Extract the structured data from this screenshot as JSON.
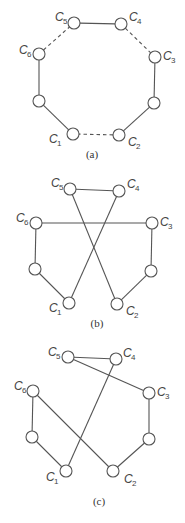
{
  "figure": {
    "panels": [
      {
        "id": "a",
        "caption": "(a)",
        "caption_pos": [
          92,
          158
        ],
        "nodes": [
          {
            "id": "C1",
            "label": "C",
            "sub": "1",
            "x": 73,
            "y": 134,
            "lx": 49,
            "ly": 143
          },
          {
            "id": "C2",
            "label": "C",
            "sub": "2",
            "x": 119,
            "y": 135,
            "lx": 128,
            "ly": 146
          },
          {
            "id": "C3",
            "label": "C",
            "sub": "3",
            "x": 155,
            "y": 57,
            "lx": 163,
            "ly": 60
          },
          {
            "id": "C4",
            "label": "C",
            "sub": "4",
            "x": 121,
            "y": 24,
            "lx": 129,
            "ly": 21
          },
          {
            "id": "C5",
            "label": "C",
            "sub": "5",
            "x": 74,
            "y": 23,
            "lx": 55,
            "ly": 21
          },
          {
            "id": "C6",
            "label": "C",
            "sub": "6",
            "x": 39,
            "y": 54,
            "lx": 19,
            "ly": 54
          },
          {
            "id": "L",
            "label": "",
            "sub": "",
            "x": 39,
            "y": 101
          },
          {
            "id": "R",
            "label": "",
            "sub": "",
            "x": 154,
            "y": 103
          }
        ],
        "edges": [
          {
            "from": "C5",
            "to": "C4",
            "style": "solid"
          },
          {
            "from": "C4",
            "to": "C3",
            "style": "dashed"
          },
          {
            "from": "C3",
            "to": "R",
            "style": "solid"
          },
          {
            "from": "R",
            "to": "C2",
            "style": "solid"
          },
          {
            "from": "C2",
            "to": "C1",
            "style": "dashed"
          },
          {
            "from": "C1",
            "to": "L",
            "style": "solid"
          },
          {
            "from": "L",
            "to": "C6",
            "style": "solid"
          },
          {
            "from": "C6",
            "to": "C5",
            "style": "dashed"
          }
        ]
      },
      {
        "id": "b",
        "caption": "(b)",
        "caption_pos": [
          97,
          327
        ],
        "nodes": [
          {
            "id": "C1",
            "label": "C",
            "sub": "1",
            "x": 69,
            "y": 303,
            "lx": 49,
            "ly": 312
          },
          {
            "id": "C2",
            "label": "C",
            "sub": "2",
            "x": 117,
            "y": 304,
            "lx": 126,
            "ly": 315
          },
          {
            "id": "C3",
            "label": "C",
            "sub": "3",
            "x": 152,
            "y": 223,
            "lx": 160,
            "ly": 226
          },
          {
            "id": "C4",
            "label": "C",
            "sub": "4",
            "x": 119,
            "y": 191,
            "lx": 127,
            "ly": 188
          },
          {
            "id": "C5",
            "label": "C",
            "sub": "5",
            "x": 70,
            "y": 189,
            "lx": 51,
            "ly": 187
          },
          {
            "id": "C6",
            "label": "C",
            "sub": "6",
            "x": 36,
            "y": 223,
            "lx": 16,
            "ly": 222
          },
          {
            "id": "L",
            "label": "",
            "sub": "",
            "x": 35,
            "y": 269
          },
          {
            "id": "R",
            "label": "",
            "sub": "",
            "x": 151,
            "y": 271
          }
        ],
        "edges": [
          {
            "from": "C5",
            "to": "C4",
            "style": "solid"
          },
          {
            "from": "C6",
            "to": "C3",
            "style": "solid"
          },
          {
            "from": "C6",
            "to": "L",
            "style": "solid"
          },
          {
            "from": "L",
            "to": "C1",
            "style": "solid"
          },
          {
            "from": "C1",
            "to": "C4",
            "style": "solid"
          },
          {
            "from": "C5",
            "to": "C2",
            "style": "solid"
          },
          {
            "from": "C2",
            "to": "R",
            "style": "solid"
          },
          {
            "from": "R",
            "to": "C3",
            "style": "solid"
          }
        ]
      },
      {
        "id": "c",
        "caption": "(c)",
        "caption_pos": [
          99,
          505
        ],
        "nodes": [
          {
            "id": "C1",
            "label": "C",
            "sub": "1",
            "x": 66,
            "y": 471,
            "lx": 46,
            "ly": 481
          },
          {
            "id": "C2",
            "label": "C",
            "sub": "2",
            "x": 113,
            "y": 471,
            "lx": 124,
            "ly": 483
          },
          {
            "id": "C3",
            "label": "C",
            "sub": "3",
            "x": 149,
            "y": 393,
            "lx": 157,
            "ly": 396
          },
          {
            "id": "C4",
            "label": "C",
            "sub": "4",
            "x": 116,
            "y": 359,
            "lx": 123,
            "ly": 357
          },
          {
            "id": "C5",
            "label": "C",
            "sub": "5",
            "x": 68,
            "y": 357,
            "lx": 48,
            "ly": 356
          },
          {
            "id": "C6",
            "label": "C",
            "sub": "6",
            "x": 33,
            "y": 391,
            "lx": 14,
            "ly": 390
          },
          {
            "id": "L",
            "label": "",
            "sub": "",
            "x": 32,
            "y": 437
          },
          {
            "id": "R",
            "label": "",
            "sub": "",
            "x": 149,
            "y": 439
          }
        ],
        "edges": [
          {
            "from": "C5",
            "to": "C4",
            "style": "solid"
          },
          {
            "from": "C5",
            "to": "C3",
            "style": "solid"
          },
          {
            "from": "C3",
            "to": "R",
            "style": "solid"
          },
          {
            "from": "R",
            "to": "C2",
            "style": "solid"
          },
          {
            "from": "C2",
            "to": "C6",
            "style": "solid"
          },
          {
            "from": "C6",
            "to": "L",
            "style": "solid"
          },
          {
            "from": "L",
            "to": "C1",
            "style": "solid"
          },
          {
            "from": "C1",
            "to": "C4",
            "style": "solid"
          }
        ]
      }
    ],
    "node_radius": 6
  }
}
